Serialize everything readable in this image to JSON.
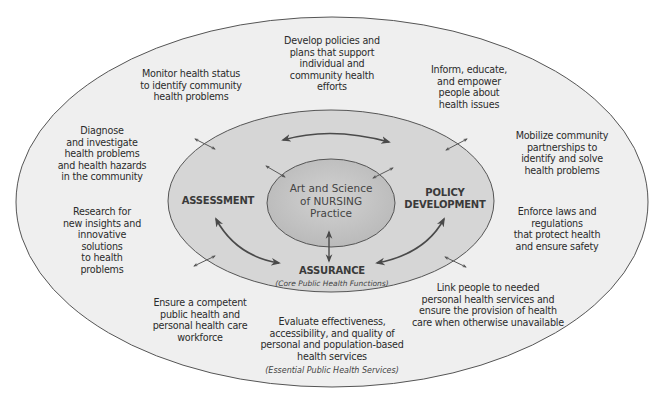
{
  "diagram": {
    "colors": {
      "background": "#ffffff",
      "outer_ellipse_fill": "#efefef",
      "middle_ellipse_fill": "#d6d6d6",
      "inner_ellipse_fill": "#c4c4c4",
      "stroke": "#4a4a4a",
      "text": "#2b2b2b"
    },
    "center": {
      "lines": [
        "Art and Science",
        "of NURSING",
        "Practice"
      ]
    },
    "core_functions": {
      "assessment": [
        "ASSESSMENT"
      ],
      "policy_development": [
        "POLICY",
        "DEVELOPMENT"
      ],
      "assurance": [
        "ASSURANCE"
      ],
      "caption": "(Core Public Health Functions)"
    },
    "essential_services": {
      "caption": "(Essential Public Health Services)",
      "items": [
        {
          "id": "monitor",
          "lines": [
            "Monitor health status",
            "to identify community",
            "health problems"
          ]
        },
        {
          "id": "develop-policies",
          "lines": [
            "Develop policies and",
            "plans that support",
            "individual and",
            "community health",
            "efforts"
          ]
        },
        {
          "id": "inform",
          "lines": [
            "Inform, educate,",
            "and empower",
            "people about",
            "health issues"
          ]
        },
        {
          "id": "diagnose",
          "lines": [
            "Diagnose",
            "and investigate",
            "health problems",
            "and health hazards",
            "in the community"
          ]
        },
        {
          "id": "mobilize",
          "lines": [
            "Mobilize community",
            "partnerships to",
            "identify and solve",
            "health problems"
          ]
        },
        {
          "id": "research",
          "lines": [
            "Research for",
            "new insights and",
            "innovative",
            "solutions",
            "to health",
            "problems"
          ]
        },
        {
          "id": "enforce",
          "lines": [
            "Enforce laws and",
            "regulations",
            "that protect health",
            "and ensure safety"
          ]
        },
        {
          "id": "workforce",
          "lines": [
            "Ensure a competent",
            "public health and",
            "personal health care",
            "workforce"
          ]
        },
        {
          "id": "link",
          "lines": [
            "Link people to needed",
            "personal health services and",
            "ensure the provision of health",
            "care when otherwise unavailable"
          ]
        },
        {
          "id": "evaluate",
          "lines": [
            "Evaluate effectiveness,",
            "accessibility, and quality of",
            "personal and population-based",
            "health services"
          ]
        }
      ]
    }
  }
}
